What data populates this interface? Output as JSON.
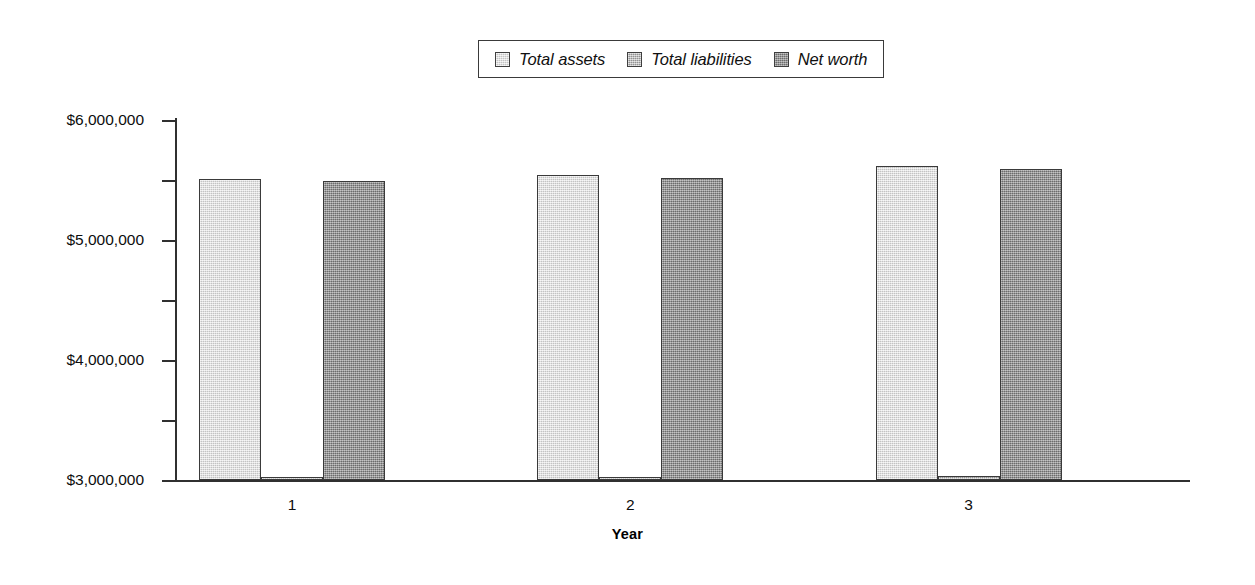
{
  "chart_data": {
    "type": "bar",
    "title": "",
    "subtitle": "",
    "xlabel": "Year",
    "ylabel": "",
    "categories": [
      "1",
      "2",
      "3"
    ],
    "series": [
      {
        "name": "Total assets",
        "values": [
          5020000,
          5090000,
          5240000
        ],
        "color": "#dadada"
      },
      {
        "name": "Total liabilities",
        "values": [
          10000,
          12000,
          60000
        ],
        "color": "#b2b2b2"
      },
      {
        "name": "Net worth",
        "values": [
          4990000,
          5040000,
          5180000
        ],
        "color": "#8d8d8d"
      }
    ],
    "ylim": [
      0,
      6000000
    ],
    "ytick_values": [
      0,
      1000000,
      2000000,
      3000000,
      4000000,
      5000000,
      6000000
    ],
    "ytick_labels": [
      "$0",
      "$1,000,000",
      "$2,000,000",
      "$3,000,000",
      "$4,000,000",
      "$5,000,000",
      "$6,000,000"
    ],
    "grid": false,
    "legend_position": "top-center"
  },
  "legend": {
    "entries": [
      {
        "label": "Total assets"
      },
      {
        "label": "Total liabilities"
      },
      {
        "label": "Net worth"
      }
    ]
  },
  "axes": {
    "x_title": "Year"
  },
  "colors": {
    "assets": "#dadada",
    "liabilities": "#b2b2b2",
    "networth": "#8d8d8d",
    "axis": "#303030",
    "text": "#0d0d0d",
    "background": "#ffffff"
  }
}
